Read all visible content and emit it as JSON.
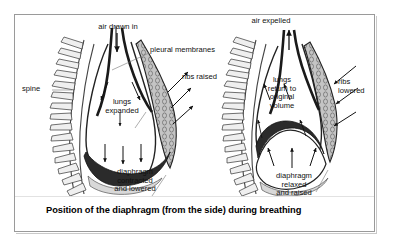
{
  "figure": {
    "caption": "Position of the diaphragm (from the side) during breathing",
    "frame_color": "#9a9a9a",
    "background_color": "#ffffff",
    "ink_color": "#111111",
    "shade_color": "#b8b8b8"
  },
  "panels": [
    {
      "id": "inhalation",
      "side": "left",
      "labels": {
        "air": "air drawn in",
        "pleural": "pleural membranes",
        "spine": "spine",
        "ribs": "ribs raised",
        "lungs": "lungs\nexpanded",
        "diaphragm": "diaphragm\ncontracted\nand lowered"
      }
    },
    {
      "id": "exhalation",
      "side": "right",
      "labels": {
        "air": "air expelled",
        "ribs": "ribs\nlowered",
        "lungs": "lungs\nreturn to\noriginal\nvolume",
        "diaphragm": "diaphragm\nrelaxed\nand raised"
      }
    }
  ]
}
